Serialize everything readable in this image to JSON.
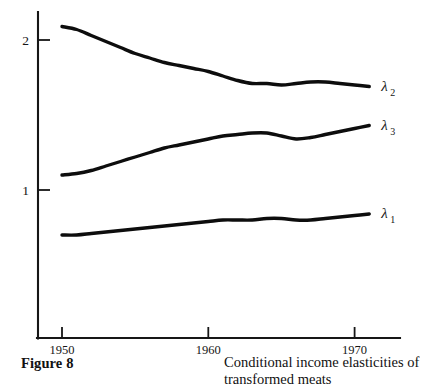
{
  "figure": {
    "number_label": "Figure 8",
    "caption": "Conditional income elasticities of transformed meats"
  },
  "axes": {
    "y_ticks": [
      {
        "label": "2",
        "value": 2
      },
      {
        "label": "1",
        "value": 1
      }
    ],
    "x_ticks": [
      {
        "label": "1950",
        "value": 1950
      },
      {
        "label": "1960",
        "value": 1960
      },
      {
        "label": "1970",
        "value": 1970
      }
    ]
  },
  "series_labels": [
    {
      "symbol": "λ",
      "subscript": "2",
      "name": "lambda-2"
    },
    {
      "symbol": "λ",
      "subscript": "3",
      "name": "lambda-3"
    },
    {
      "symbol": "λ",
      "subscript": "1",
      "name": "lambda-1"
    }
  ],
  "colors": {
    "ink": "#0d0d0d",
    "axis": "#161616",
    "background": "#ffffff"
  },
  "chart_data": {
    "type": "line",
    "title": "Conditional income elasticities of transformed meats",
    "xlabel": "",
    "ylabel": "",
    "xlim": [
      1949.3,
      1972.0
    ],
    "ylim": [
      0.0,
      2.2
    ],
    "grid": false,
    "legend": "inline-right-of-curve-ends",
    "x": [
      1950,
      1951,
      1952,
      1953,
      1954,
      1955,
      1956,
      1957,
      1958,
      1959,
      1960,
      1961,
      1962,
      1963,
      1964,
      1965,
      1966,
      1967,
      1968,
      1969,
      1970,
      1971
    ],
    "series": [
      {
        "name": "lambda-2",
        "label": "λ2",
        "values": [
          2.09,
          2.07,
          2.03,
          1.99,
          1.95,
          1.91,
          1.88,
          1.85,
          1.83,
          1.81,
          1.79,
          1.76,
          1.73,
          1.71,
          1.71,
          1.7,
          1.71,
          1.72,
          1.72,
          1.71,
          1.7,
          1.69
        ]
      },
      {
        "name": "lambda-3",
        "label": "λ3",
        "values": [
          1.1,
          1.11,
          1.13,
          1.16,
          1.19,
          1.22,
          1.25,
          1.28,
          1.3,
          1.32,
          1.34,
          1.36,
          1.37,
          1.38,
          1.38,
          1.36,
          1.34,
          1.35,
          1.37,
          1.39,
          1.41,
          1.43
        ]
      },
      {
        "name": "lambda-1",
        "label": "λ1",
        "values": [
          0.7,
          0.7,
          0.71,
          0.72,
          0.73,
          0.74,
          0.75,
          0.76,
          0.77,
          0.78,
          0.79,
          0.8,
          0.8,
          0.8,
          0.81,
          0.81,
          0.8,
          0.8,
          0.81,
          0.82,
          0.83,
          0.84
        ]
      }
    ]
  }
}
